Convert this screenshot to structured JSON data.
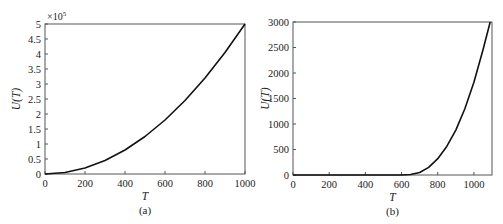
{
  "figure": {
    "panels": [
      {
        "caption": "(a)",
        "xlabel": "T",
        "ylabel": "U(T)",
        "multiplier": "×10",
        "multiplier_exp": "5",
        "box": {
          "x0": 45,
          "x1": 245,
          "y0": 174,
          "y1": 24
        },
        "xlim": [
          0,
          1000
        ],
        "ylim": [
          0,
          5
        ],
        "xticks": [
          0,
          200,
          400,
          600,
          800,
          1000
        ],
        "xtick_labels": [
          "0",
          "200",
          "400",
          "600",
          "800",
          "1000"
        ],
        "yticks": [
          0,
          0.5,
          1,
          1.5,
          2,
          2.5,
          3,
          3.5,
          4,
          4.5,
          5
        ],
        "ytick_labels": [
          "0",
          "0.5",
          "1",
          "1.5",
          "2",
          "2.5",
          "3",
          "3.5",
          "4",
          "4.5",
          "5"
        ]
      },
      {
        "caption": "(b)",
        "xlabel": "T",
        "ylabel": "U(T)",
        "multiplier": "",
        "multiplier_exp": "",
        "box": {
          "x0": 293,
          "x1": 492,
          "y0": 175,
          "y1": 22
        },
        "xlim": [
          0,
          1100
        ],
        "ylim": [
          0,
          3000
        ],
        "xticks": [
          0,
          200,
          400,
          600,
          800,
          1000
        ],
        "xtick_labels": [
          "0",
          "200",
          "400",
          "600",
          "800",
          "1000"
        ],
        "yticks": [
          0,
          500,
          1000,
          1500,
          2000,
          2500,
          3000
        ],
        "ytick_labels": [
          "0",
          "500",
          "1000",
          "1500",
          "2000",
          "2500",
          "3000"
        ]
      }
    ]
  },
  "chart_data": [
    {
      "type": "line",
      "title": "(a)",
      "xlabel": "T",
      "ylabel": "U(T)",
      "y_multiplier": "×10^5",
      "xlim": [
        0,
        1000
      ],
      "ylim": [
        0,
        5
      ],
      "grid": false,
      "legend": null,
      "series": [
        {
          "name": "U(T)",
          "x": [
            0,
            100,
            200,
            300,
            400,
            500,
            600,
            700,
            800,
            900,
            1000
          ],
          "values": [
            0,
            0.05,
            0.2,
            0.45,
            0.8,
            1.25,
            1.8,
            2.45,
            3.2,
            4.05,
            5.0
          ]
        }
      ]
    },
    {
      "type": "line",
      "title": "(b)",
      "xlabel": "T",
      "ylabel": "U(T)",
      "xlim": [
        0,
        1100
      ],
      "ylim": [
        0,
        3000
      ],
      "grid": false,
      "legend": null,
      "series": [
        {
          "name": "U(T)",
          "x": [
            0,
            200,
            400,
            600,
            650,
            700,
            750,
            800,
            850,
            900,
            950,
            1000,
            1050,
            1090
          ],
          "values": [
            0,
            0,
            0,
            0,
            10,
            50,
            150,
            320,
            560,
            880,
            1300,
            1820,
            2450,
            3000
          ]
        }
      ]
    }
  ]
}
